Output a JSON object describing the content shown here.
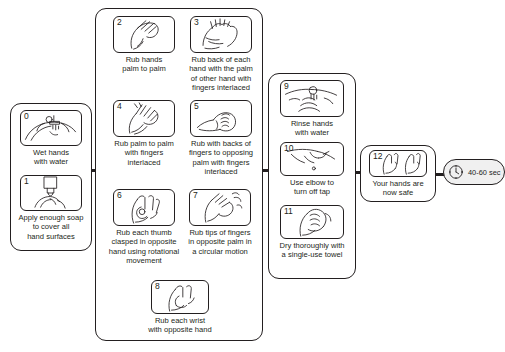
{
  "diagram": {
    "line_color": "#231f20",
    "background": "#ffffff"
  },
  "groups": [
    {
      "id": "panel-1",
      "name": "preparation-group"
    },
    {
      "id": "panel-2",
      "name": "scrubbing-group"
    },
    {
      "id": "panel-3",
      "name": "rinse-dry-group"
    },
    {
      "id": "panel-4",
      "name": "completion-group"
    }
  ],
  "steps": [
    {
      "number": "0",
      "caption": "Wet hands\nwith water",
      "icon": "wet-hands-under-tap-icon"
    },
    {
      "number": "1",
      "caption": "Apply enough soap\nto cover all\nhand surfaces",
      "icon": "soap-dispenser-icon"
    },
    {
      "number": "2",
      "caption": "Rub hands\npalm to palm",
      "icon": "palm-to-palm-icon"
    },
    {
      "number": "3",
      "caption": "Rub back of each\nhand with the palm\nof other hand with\nfingers interlaced",
      "icon": "back-of-hand-icon"
    },
    {
      "number": "4",
      "caption": "Rub palm to palm\nwith fingers\ninterlaced",
      "icon": "fingers-interlaced-icon"
    },
    {
      "number": "5",
      "caption": "Rub with backs of\nfingers to opposing\npalm with fingers\ninterlaced",
      "icon": "backs-of-fingers-icon"
    },
    {
      "number": "6",
      "caption": "Rub each thumb\nclasped in opposite\nhand using rotational\nmovement",
      "icon": "thumb-rotation-icon"
    },
    {
      "number": "7",
      "caption": "Rub tips of fingers\nin opposite palm in\na circular motion",
      "icon": "fingertips-circular-icon"
    },
    {
      "number": "8",
      "caption": "Rub each wrist\nwith opposite hand",
      "icon": "wrist-rub-icon"
    },
    {
      "number": "9",
      "caption": "Rinse hands\nwith water",
      "icon": "rinse-hands-icon"
    },
    {
      "number": "10",
      "caption": "Use elbow to\nturn off tap",
      "icon": "elbow-tap-icon"
    },
    {
      "number": "11",
      "caption": "Dry thoroughly with\na single-use towel",
      "icon": "towel-dry-icon"
    },
    {
      "number": "12",
      "caption": "Your hands are\nnow safe",
      "icon": "clean-hands-icon"
    }
  ],
  "timer": {
    "label": "40-60 sec",
    "icon": "clock-icon"
  }
}
